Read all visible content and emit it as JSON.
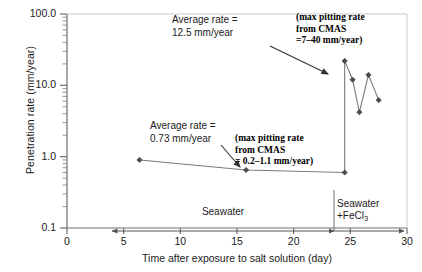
{
  "chart_data": {
    "type": "line",
    "title": "",
    "xlabel": "Time after exposure to salt solution (day)",
    "ylabel": "Penetration rate (mm/year)",
    "xlim": [
      0,
      30
    ],
    "ylim": [
      0.1,
      100.0
    ],
    "yscale": "log",
    "xscale": "linear",
    "grid": false,
    "legend": "none",
    "xticks": [
      "0",
      "5",
      "10",
      "15",
      "20",
      "25",
      "30"
    ],
    "xtick_values": [
      0,
      5,
      10,
      15,
      20,
      25,
      30
    ],
    "yticks": [
      "0.1",
      "1.0",
      "10.0",
      "100.0"
    ],
    "ytick_values": [
      0.1,
      1.0,
      10.0,
      100.0
    ],
    "series": [
      {
        "name": "Penetration rate",
        "marker": "diamond",
        "x": [
          6.4,
          15.8,
          24.5,
          24.5,
          25.2,
          25.8,
          26.6,
          27.5
        ],
        "y": [
          0.9,
          0.65,
          0.6,
          22.0,
          12.0,
          4.2,
          14.0,
          6.2
        ]
      }
    ],
    "annotations": [
      {
        "id": "avg-rate-high",
        "text_lines": [
          "Average rate =",
          "12.5 mm/year"
        ],
        "style": "sans",
        "arrow_to": [
          24.5,
          22.0
        ]
      },
      {
        "id": "avg-rate-low",
        "text_lines": [
          "Average rate =",
          "0.73 mm/year"
        ],
        "style": "sans",
        "arrow_to": [
          15.8,
          0.65
        ]
      },
      {
        "id": "cmas-high",
        "text_lines": [
          "(max pitting rate",
          "from CMAS",
          "=7–40 mm/year)"
        ],
        "style": "serif-bold"
      },
      {
        "id": "cmas-low",
        "text_lines": [
          "(max pitting rate",
          "from CMAS",
          "= 0.2–1.1 mm/year)"
        ],
        "style": "serif-bold"
      }
    ],
    "phase_bars": [
      {
        "id": "seawater",
        "label": "Seawater",
        "from": 4.0,
        "to": 24.5
      },
      {
        "id": "seawater-fecl3",
        "label_main": "Seawater",
        "label_sub": "+FeCl",
        "label_subscript": "3",
        "from": 24.5,
        "to": 30.0
      }
    ],
    "divider_x": 24.5
  },
  "colors": {
    "axis": "#6e6e6e",
    "data_line": "#7a7a7a",
    "marker": "#4a4a4a",
    "annotation_arrow": "#333333",
    "text": "#1a1a1a"
  }
}
